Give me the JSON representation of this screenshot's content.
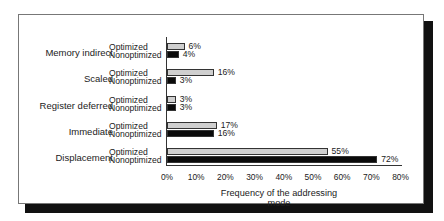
{
  "chart_data": {
    "type": "bar",
    "orientation": "horizontal",
    "title": "",
    "xlabel": "Frequency of the addressing mode",
    "ylabel": "",
    "xlim": [
      0,
      80
    ],
    "x_ticks": [
      "0%",
      "10%",
      "20%",
      "30%",
      "40%",
      "50%",
      "60%",
      "70%",
      "80%"
    ],
    "categories": [
      "Memory indirect",
      "Scaled",
      "Register deferred",
      "Immediate",
      "Displacement"
    ],
    "series": [
      {
        "name": "Optimized",
        "color": "#cfcfcf",
        "values": [
          6,
          16,
          3,
          17,
          55
        ]
      },
      {
        "name": "Nonoptimized",
        "color": "#0a0a0a",
        "values": [
          4,
          3,
          3,
          16,
          72
        ]
      }
    ],
    "value_labels": {
      "Optimized": [
        "6%",
        "16%",
        "3%",
        "17%",
        "55%"
      ],
      "Nonoptimized": [
        "4%",
        "3%",
        "3%",
        "16%",
        "72%"
      ]
    },
    "grid": false,
    "legend": "inline row labels"
  }
}
